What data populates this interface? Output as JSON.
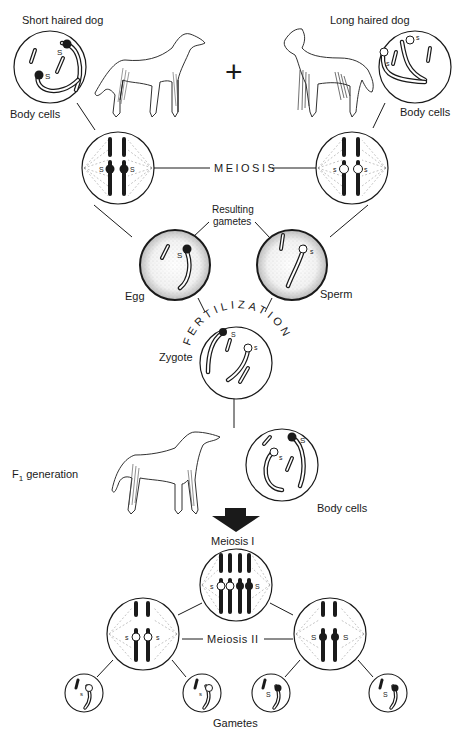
{
  "diagram": {
    "parents": {
      "short": {
        "label": "Short haired dog",
        "cells_label": "Body cells"
      },
      "long": {
        "label": "Long haired dog",
        "cells_label": "Body cells"
      },
      "cross_symbol": "+"
    },
    "meiosis_label": "MEIOSIS",
    "gametes_label_line1": "Resulting",
    "gametes_label_line2": "gametes",
    "egg_label": "Egg",
    "sperm_label": "Sperm",
    "fertilization_label": "FERTILIZATION",
    "zygote_label": "Zygote",
    "f1_label": "F",
    "f1_sub": "1",
    "f1_rest": " generation",
    "f1_cells_label": "Body cells",
    "meiosis1_label": "Meiosis I",
    "meiosis2_label": "Meiosis II",
    "final_gametes_label": "Gametes",
    "alleles": {
      "dominant": "S",
      "recessive": "s"
    },
    "colors": {
      "ink": "#1a1a1a",
      "background": "#ffffff",
      "stipple": "#b8b8b8"
    }
  }
}
